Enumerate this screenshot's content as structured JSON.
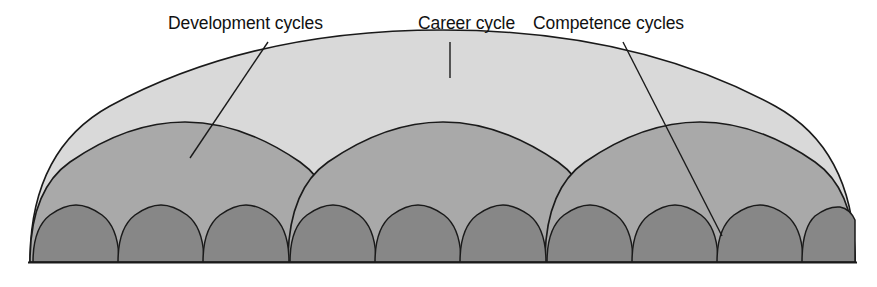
{
  "figure": {
    "kind": "nested-arc-dome-diagram",
    "background_color": "#ffffff",
    "baseline_y": 262,
    "labels": [
      {
        "id": "development",
        "text": "Development cycles"
      },
      {
        "id": "career",
        "text": "Career cycle"
      },
      {
        "id": "competence",
        "text": "Competence cycles"
      }
    ],
    "layers": [
      {
        "id": "career-cycle",
        "name": "Career cycle",
        "level": 1,
        "count": 1,
        "fill": "#d9d9d9",
        "stroke": "#1a1a1a",
        "span_x": [
          30,
          855
        ],
        "apex_y": 75
      },
      {
        "id": "development-cycles",
        "name": "Development cycles",
        "level": 2,
        "count": 3,
        "fill": "#a9a9a9",
        "stroke": "#1a1a1a",
        "apex_y": 152,
        "apex_x": [
          185,
          443,
          700
        ]
      },
      {
        "id": "competence-cycles",
        "name": "Competence cycles",
        "level": 3,
        "count": 9,
        "fill": "#878787",
        "stroke": "#1a1a1a",
        "apex_y": 235,
        "apex_x": [
          76,
          161,
          246,
          331,
          416,
          501,
          586,
          671,
          756
        ]
      }
    ],
    "leaders": [
      {
        "id": "leader-development",
        "from": [
          268,
          42
        ],
        "to": [
          190,
          158
        ]
      },
      {
        "id": "leader-career",
        "from": [
          450,
          42
        ],
        "to": [
          450,
          77
        ]
      },
      {
        "id": "leader-competence",
        "from": [
          623,
          42
        ],
        "to": [
          722,
          236
        ]
      }
    ]
  }
}
